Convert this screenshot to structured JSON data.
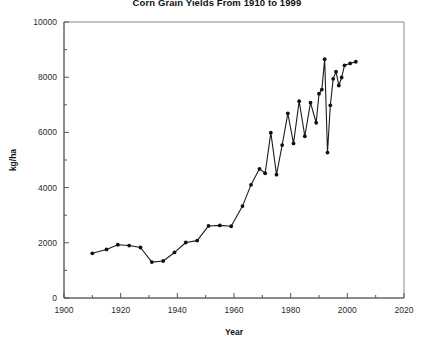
{
  "chart_data": {
    "type": "line",
    "title": "Corn Grain Yields From 1910 to 1999",
    "xlabel": "Year",
    "ylabel": "kg/ha",
    "xlim": [
      1900,
      2020
    ],
    "ylim": [
      0,
      10000
    ],
    "grid": false,
    "legend": "none",
    "x_ticks_major": [
      1900,
      1920,
      1940,
      1960,
      1980,
      2000,
      2020
    ],
    "x_ticks_minor": [
      1910,
      1930,
      1950,
      1970,
      1990,
      2010
    ],
    "y_ticks_major": [
      0,
      2000,
      4000,
      6000,
      8000,
      10000
    ],
    "y_ticks_minor": [
      1000,
      3000,
      5000,
      7000,
      9000
    ],
    "marker": "filled-circle",
    "series": [
      {
        "name": "Corn grain yield",
        "x": [
          1910,
          1915,
          1919,
          1923,
          1927,
          1931,
          1935,
          1939,
          1943,
          1947,
          1951,
          1955,
          1959,
          1963,
          1966,
          1969,
          1971,
          1973,
          1975,
          1977,
          1979,
          1981,
          1983,
          1985,
          1987,
          1989,
          1990,
          1991,
          1992,
          1993,
          1994,
          1995,
          1996,
          1997,
          1998,
          1999,
          2001,
          2003
        ],
        "values": [
          1620,
          1760,
          1930,
          1900,
          1830,
          1300,
          1340,
          1650,
          2010,
          2080,
          2610,
          2630,
          2600,
          3330,
          4100,
          4680,
          4520,
          5990,
          4470,
          5540,
          6690,
          5600,
          7130,
          5860,
          7080,
          6350,
          7400,
          7550,
          8650,
          5270,
          6980,
          7940,
          8200,
          7700,
          7990,
          8430,
          8500,
          8560
        ]
      }
    ]
  }
}
